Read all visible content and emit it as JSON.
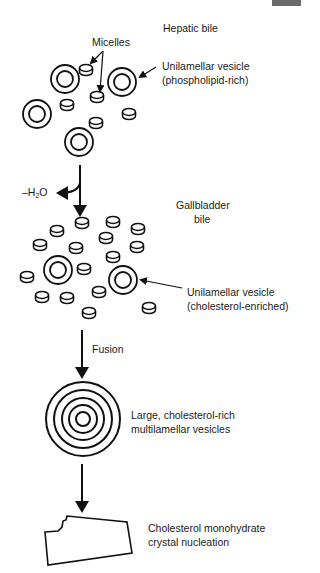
{
  "figure": {
    "corner_tab_color": "#6b6b6b",
    "stroke_color": "#111111"
  },
  "stages": {
    "hepatic": {
      "title": "Hepatic bile",
      "micelles_label": "Micelles",
      "vesicle_label_line1": "Unilamellar vesicle",
      "vesicle_label_line2": "(phospholipid-rich)"
    },
    "water_loss": {
      "label_prefix": "–H",
      "label_sub": "2",
      "label_suffix": "O"
    },
    "gallbladder": {
      "title_line1": "Gallbladder",
      "title_line2": "bile",
      "vesicle_label_line1": "Unilamellar vesicle",
      "vesicle_label_line2": "(cholesterol-enriched)"
    },
    "fusion": {
      "label": "Fusion"
    },
    "multilamellar": {
      "label_line1": "Large, cholesterol-rich",
      "label_line2": "multilamellar vesicles"
    },
    "crystal": {
      "label_line1": "Cholesterol monohydrate",
      "label_line2": "crystal nucleation"
    }
  },
  "shapes": {
    "hepatic_vesicles": [
      {
        "cx": 65,
        "cy": 79
      },
      {
        "cx": 122,
        "cy": 82
      },
      {
        "cx": 37,
        "cy": 114
      },
      {
        "cx": 79,
        "cy": 142
      }
    ],
    "hepatic_micelles": [
      {
        "cx": 86,
        "cy": 70
      },
      {
        "cx": 67,
        "cy": 105
      },
      {
        "cx": 97,
        "cy": 97
      },
      {
        "cx": 129,
        "cy": 114
      },
      {
        "cx": 96,
        "cy": 123
      }
    ],
    "gallbladder_vesicles": [
      {
        "cx": 58,
        "cy": 270
      },
      {
        "cx": 123,
        "cy": 280
      }
    ],
    "gallbladder_micelles": [
      {
        "cx": 82,
        "cy": 223
      },
      {
        "cx": 57,
        "cy": 231
      },
      {
        "cx": 113,
        "cy": 222
      },
      {
        "cx": 138,
        "cy": 229
      },
      {
        "cx": 40,
        "cy": 245
      },
      {
        "cx": 76,
        "cy": 248
      },
      {
        "cx": 106,
        "cy": 238
      },
      {
        "cx": 137,
        "cy": 247
      },
      {
        "cx": 113,
        "cy": 257
      },
      {
        "cx": 84,
        "cy": 269
      },
      {
        "cx": 27,
        "cy": 277
      },
      {
        "cx": 42,
        "cy": 297
      },
      {
        "cx": 67,
        "cy": 298
      },
      {
        "cx": 99,
        "cy": 292
      },
      {
        "cx": 89,
        "cy": 313
      },
      {
        "cx": 149,
        "cy": 308
      }
    ],
    "multilamellar": {
      "cx": 83,
      "cy": 419,
      "radii": [
        37,
        29,
        21,
        14,
        7
      ]
    }
  }
}
